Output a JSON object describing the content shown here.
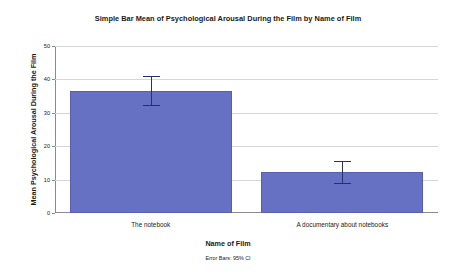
{
  "chart_data": {
    "type": "bar",
    "title": "Simple Bar Mean of Psychological Arousal During the Film by Name of Film",
    "xlabel": "Name of Film",
    "ylabel": "Mean Psychological Arousal During the Film",
    "footnote": "Error Bars: 95% CI",
    "categories": [
      "The notebook",
      "A documentary about notebooks"
    ],
    "values": [
      36.5,
      12.3
    ],
    "error_low": [
      32.0,
      8.7
    ],
    "error_high": [
      41.0,
      15.6
    ],
    "ylim": [
      0,
      50
    ],
    "yticks": [
      0,
      10,
      20,
      30,
      40,
      50
    ],
    "ytick_labels": [
      "0",
      "10",
      "20",
      "30",
      "40",
      "50"
    ],
    "grid": true,
    "legend": "none",
    "bar_color": "#6671C4",
    "error_color": "#26306b",
    "grid_color": "#d6d6d6",
    "axis_color": "#8a8a8a"
  }
}
